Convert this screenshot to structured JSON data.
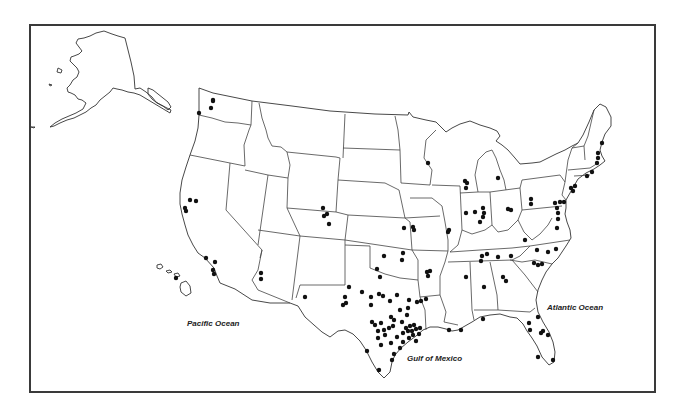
{
  "map": {
    "title": "",
    "frame": {
      "x": 29,
      "y": 24,
      "width": 627,
      "height": 369,
      "border_color": "#3a3a3a"
    },
    "labels": {
      "pacific": "Pacific Ocean",
      "gulf": "Gulf of Mexico",
      "atlantic": "Atlantic Ocean"
    },
    "label_positions": {
      "pacific": {
        "x": 187,
        "y": 319
      },
      "gulf": {
        "x": 407,
        "y": 354
      },
      "atlantic": {
        "x": 547,
        "y": 303
      }
    },
    "dot_color": "#111111",
    "line_color": "#444444",
    "regions_shown": [
      "Alaska",
      "Hawaii",
      "Contiguous United States"
    ],
    "points": [
      {
        "region": "WA",
        "x": 213,
        "y": 101
      },
      {
        "region": "WA",
        "x": 211,
        "y": 108
      },
      {
        "region": "OR",
        "x": 199,
        "y": 113
      },
      {
        "region": "CA",
        "x": 190,
        "y": 200
      },
      {
        "region": "CA",
        "x": 196,
        "y": 201
      },
      {
        "region": "CA",
        "x": 185,
        "y": 208
      },
      {
        "region": "CA",
        "x": 186,
        "y": 211
      },
      {
        "region": "CA",
        "x": 206,
        "y": 258
      },
      {
        "region": "CA",
        "x": 215,
        "y": 262
      },
      {
        "region": "CA",
        "x": 213,
        "y": 270
      },
      {
        "region": "CA",
        "x": 214,
        "y": 274
      },
      {
        "region": "HI",
        "x": 176,
        "y": 278
      },
      {
        "region": "AZ",
        "x": 261,
        "y": 273
      },
      {
        "region": "AZ",
        "x": 261,
        "y": 279
      },
      {
        "region": "NM",
        "x": 305,
        "y": 297
      },
      {
        "region": "CO",
        "x": 323,
        "y": 208
      },
      {
        "region": "CO",
        "x": 324,
        "y": 216
      },
      {
        "region": "CO",
        "x": 327,
        "y": 214
      },
      {
        "region": "CO",
        "x": 329,
        "y": 224
      },
      {
        "region": "KS",
        "x": 404,
        "y": 228
      },
      {
        "region": "MO",
        "x": 413,
        "y": 227
      },
      {
        "region": "MO",
        "x": 414,
        "y": 230
      },
      {
        "region": "OK",
        "x": 384,
        "y": 256
      },
      {
        "region": "OK",
        "x": 403,
        "y": 253
      },
      {
        "region": "OK",
        "x": 402,
        "y": 260
      },
      {
        "region": "OK",
        "x": 377,
        "y": 269
      },
      {
        "region": "OK",
        "x": 380,
        "y": 277
      },
      {
        "region": "AR",
        "x": 427,
        "y": 272
      },
      {
        "region": "AR",
        "x": 430,
        "y": 271
      },
      {
        "region": "AR",
        "x": 428,
        "y": 276
      },
      {
        "region": "TX",
        "x": 349,
        "y": 287
      },
      {
        "region": "TX",
        "x": 345,
        "y": 297
      },
      {
        "region": "TX",
        "x": 346,
        "y": 303
      },
      {
        "region": "TX",
        "x": 343,
        "y": 305
      },
      {
        "region": "TX",
        "x": 362,
        "y": 292
      },
      {
        "region": "TX",
        "x": 371,
        "y": 297
      },
      {
        "region": "TX",
        "x": 371,
        "y": 305
      },
      {
        "region": "TX",
        "x": 379,
        "y": 294
      },
      {
        "region": "TX",
        "x": 383,
        "y": 296
      },
      {
        "region": "TX",
        "x": 390,
        "y": 301
      },
      {
        "region": "TX",
        "x": 397,
        "y": 295
      },
      {
        "region": "TX",
        "x": 409,
        "y": 300
      },
      {
        "region": "TX",
        "x": 408,
        "y": 308
      },
      {
        "region": "TX",
        "x": 417,
        "y": 302
      },
      {
        "region": "TX",
        "x": 426,
        "y": 299
      },
      {
        "region": "TX",
        "x": 400,
        "y": 310
      },
      {
        "region": "TX",
        "x": 402,
        "y": 322
      },
      {
        "region": "TX",
        "x": 407,
        "y": 315
      },
      {
        "region": "TX",
        "x": 391,
        "y": 317
      },
      {
        "region": "TX",
        "x": 381,
        "y": 323
      },
      {
        "region": "TX",
        "x": 384,
        "y": 330
      },
      {
        "region": "TX",
        "x": 385,
        "y": 335
      },
      {
        "region": "TX",
        "x": 389,
        "y": 328
      },
      {
        "region": "TX",
        "x": 393,
        "y": 326
      },
      {
        "region": "TX",
        "x": 394,
        "y": 320
      },
      {
        "region": "TX",
        "x": 372,
        "y": 322
      },
      {
        "region": "TX",
        "x": 375,
        "y": 325
      },
      {
        "region": "TX",
        "x": 378,
        "y": 331
      },
      {
        "region": "TX",
        "x": 378,
        "y": 338
      },
      {
        "region": "TX",
        "x": 381,
        "y": 345
      },
      {
        "region": "TX",
        "x": 391,
        "y": 343
      },
      {
        "region": "TX",
        "x": 397,
        "y": 337
      },
      {
        "region": "TX",
        "x": 403,
        "y": 333
      },
      {
        "region": "TX",
        "x": 406,
        "y": 328
      },
      {
        "region": "TX",
        "x": 408,
        "y": 331
      },
      {
        "region": "TX",
        "x": 410,
        "y": 326
      },
      {
        "region": "TX",
        "x": 412,
        "y": 331
      },
      {
        "region": "TX",
        "x": 414,
        "y": 325
      },
      {
        "region": "TX",
        "x": 416,
        "y": 329
      },
      {
        "region": "TX",
        "x": 413,
        "y": 335
      },
      {
        "region": "TX",
        "x": 409,
        "y": 338
      },
      {
        "region": "TX",
        "x": 419,
        "y": 334
      },
      {
        "region": "TX",
        "x": 420,
        "y": 328
      },
      {
        "region": "TX",
        "x": 416,
        "y": 341
      },
      {
        "region": "TX",
        "x": 403,
        "y": 342
      },
      {
        "region": "TX",
        "x": 400,
        "y": 348
      },
      {
        "region": "TX",
        "x": 394,
        "y": 354
      },
      {
        "region": "TX",
        "x": 392,
        "y": 360
      },
      {
        "region": "TX",
        "x": 367,
        "y": 351
      },
      {
        "region": "TX",
        "x": 379,
        "y": 370
      },
      {
        "region": "LA",
        "x": 421,
        "y": 301
      },
      {
        "region": "LA",
        "x": 449,
        "y": 330
      },
      {
        "region": "LA",
        "x": 461,
        "y": 330
      },
      {
        "region": "MS",
        "x": 466,
        "y": 277
      },
      {
        "region": "AL",
        "x": 484,
        "y": 287
      },
      {
        "region": "GA",
        "x": 503,
        "y": 277
      },
      {
        "region": "GA",
        "x": 506,
        "y": 281
      },
      {
        "region": "FL",
        "x": 483,
        "y": 319
      },
      {
        "region": "FL",
        "x": 538,
        "y": 317
      },
      {
        "region": "FL",
        "x": 529,
        "y": 323
      },
      {
        "region": "FL",
        "x": 530,
        "y": 330
      },
      {
        "region": "FL",
        "x": 541,
        "y": 333
      },
      {
        "region": "FL",
        "x": 543,
        "y": 331
      },
      {
        "region": "FL",
        "x": 548,
        "y": 335
      },
      {
        "region": "FL",
        "x": 538,
        "y": 357
      },
      {
        "region": "FL",
        "x": 553,
        "y": 360
      },
      {
        "region": "WI",
        "x": 428,
        "y": 163
      },
      {
        "region": "IL",
        "x": 465,
        "y": 181
      },
      {
        "region": "IL",
        "x": 467,
        "y": 183
      },
      {
        "region": "IL",
        "x": 466,
        "y": 188
      },
      {
        "region": "IL",
        "x": 466,
        "y": 213
      },
      {
        "region": "IL",
        "x": 449,
        "y": 230
      },
      {
        "region": "IL",
        "x": 448,
        "y": 232
      },
      {
        "region": "IN",
        "x": 475,
        "y": 212
      },
      {
        "region": "IN",
        "x": 483,
        "y": 208
      },
      {
        "region": "IN",
        "x": 484,
        "y": 213
      },
      {
        "region": "IN",
        "x": 483,
        "y": 217
      },
      {
        "region": "IN",
        "x": 480,
        "y": 222
      },
      {
        "region": "MI",
        "x": 498,
        "y": 178
      },
      {
        "region": "OH",
        "x": 508,
        "y": 209
      },
      {
        "region": "OH",
        "x": 511,
        "y": 210
      },
      {
        "region": "PA",
        "x": 531,
        "y": 199
      },
      {
        "region": "PA",
        "x": 531,
        "y": 204
      },
      {
        "region": "PA",
        "x": 555,
        "y": 203
      },
      {
        "region": "PA",
        "x": 560,
        "y": 202
      },
      {
        "region": "PA",
        "x": 564,
        "y": 202
      },
      {
        "region": "MD",
        "x": 557,
        "y": 208
      },
      {
        "region": "MD",
        "x": 558,
        "y": 213
      },
      {
        "region": "MD",
        "x": 558,
        "y": 219
      },
      {
        "region": "VA",
        "x": 557,
        "y": 228
      },
      {
        "region": "VA",
        "x": 556,
        "y": 249
      },
      {
        "region": "WV",
        "x": 525,
        "y": 240
      },
      {
        "region": "TN",
        "x": 482,
        "y": 256
      },
      {
        "region": "TN",
        "x": 481,
        "y": 261
      },
      {
        "region": "TN",
        "x": 487,
        "y": 254
      },
      {
        "region": "TN",
        "x": 498,
        "y": 257
      },
      {
        "region": "TN",
        "x": 511,
        "y": 256
      },
      {
        "region": "NC",
        "x": 537,
        "y": 250
      },
      {
        "region": "NC",
        "x": 548,
        "y": 252
      },
      {
        "region": "NC",
        "x": 542,
        "y": 264
      },
      {
        "region": "NC",
        "x": 538,
        "y": 265
      },
      {
        "region": "NC",
        "x": 534,
        "y": 263
      },
      {
        "region": "NJ",
        "x": 571,
        "y": 188
      },
      {
        "region": "NJ",
        "x": 573,
        "y": 191
      },
      {
        "region": "NY",
        "x": 575,
        "y": 186
      },
      {
        "region": "CT",
        "x": 587,
        "y": 176
      },
      {
        "region": "CT",
        "x": 592,
        "y": 172
      },
      {
        "region": "MA",
        "x": 597,
        "y": 163
      },
      {
        "region": "MA",
        "x": 598,
        "y": 158
      },
      {
        "region": "NH",
        "x": 598,
        "y": 153
      },
      {
        "region": "ME",
        "x": 602,
        "y": 143
      },
      {
        "region": "AK",
        "x": 213,
        "y": 100
      }
    ]
  }
}
